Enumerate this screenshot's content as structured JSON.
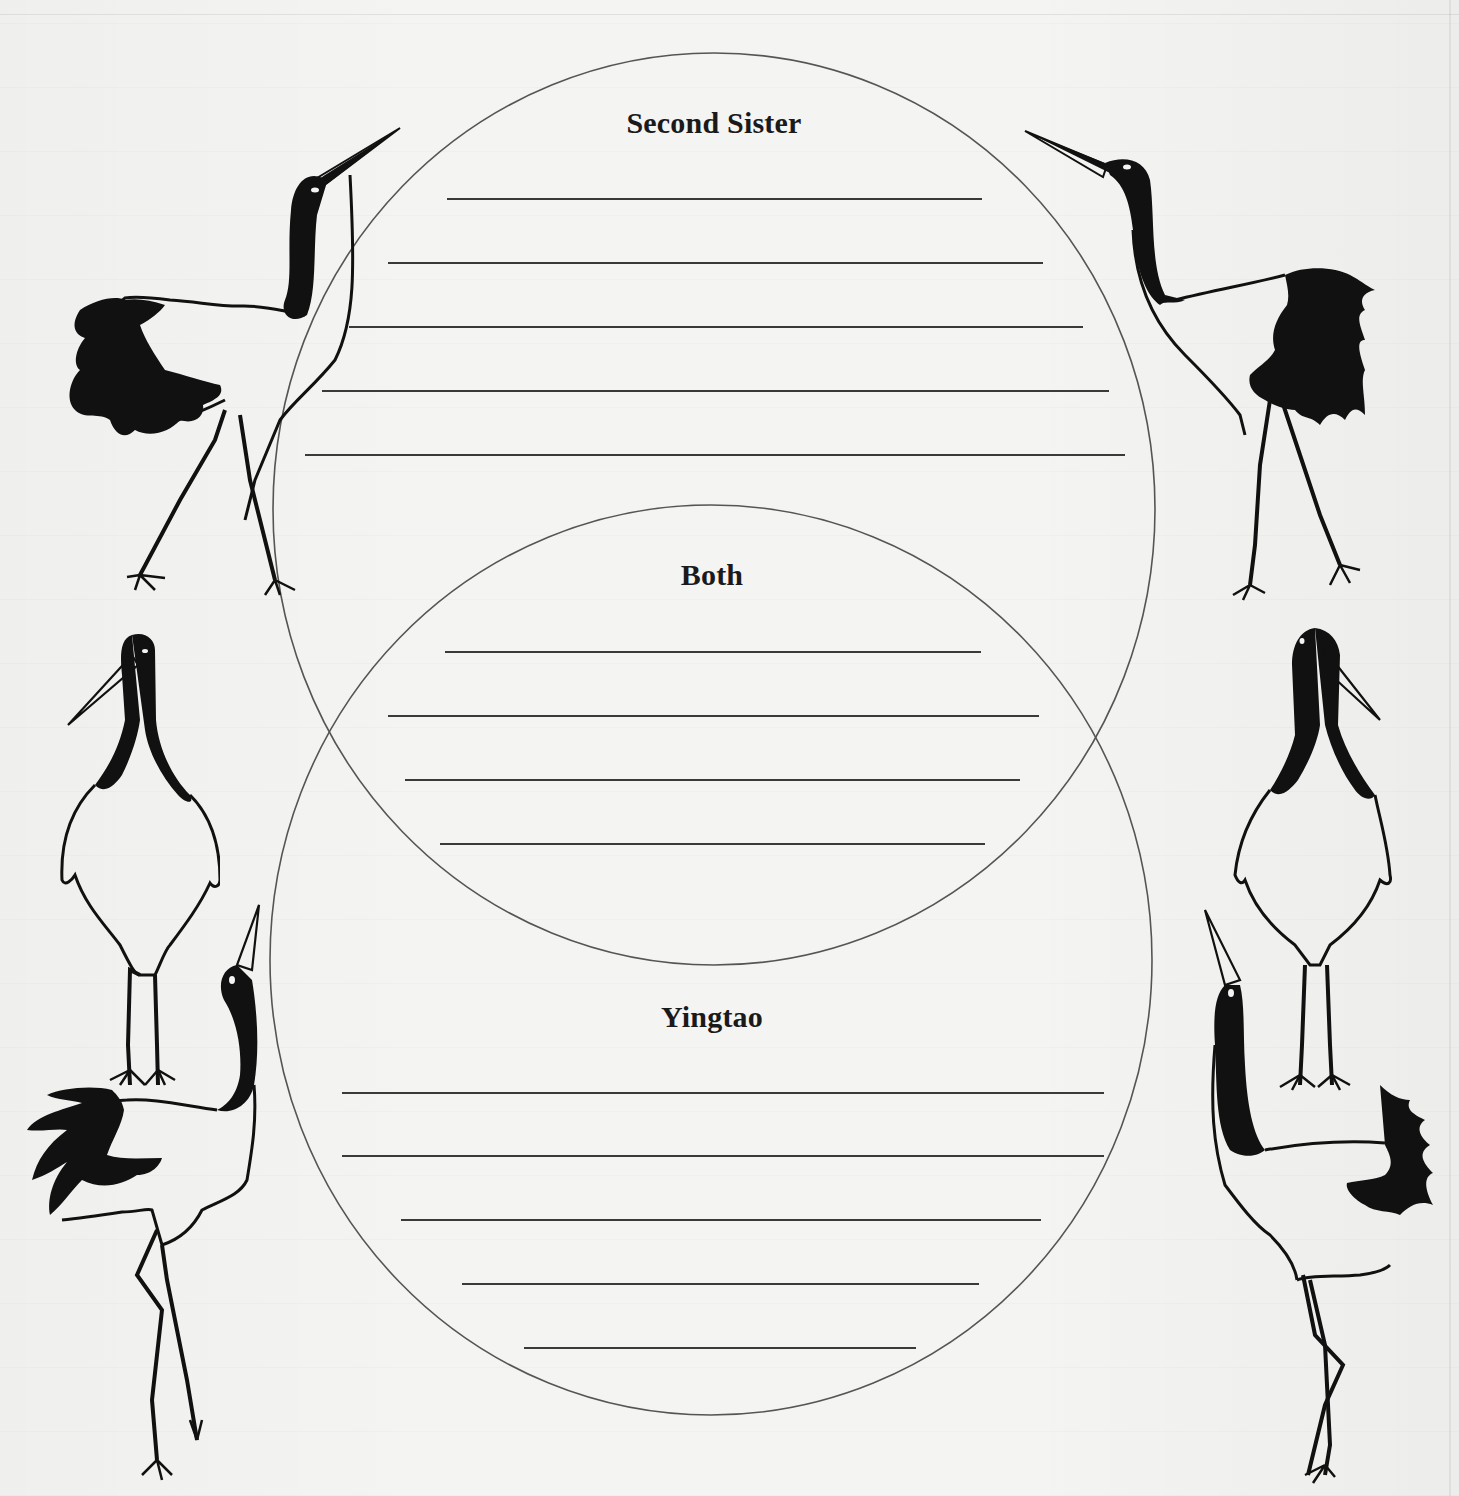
{
  "worksheet": {
    "type": "venn-diagram",
    "sections": {
      "top": {
        "label": "Second Sister"
      },
      "overlap": {
        "label": "Both"
      },
      "bottom": {
        "label": "Yingtao"
      }
    },
    "write_lines": {
      "top": [
        {
          "x1": 447,
          "x2": 982,
          "y": 198
        },
        {
          "x1": 388,
          "x2": 1043,
          "y": 262
        },
        {
          "x1": 349,
          "x2": 1083,
          "y": 326
        },
        {
          "x1": 322,
          "x2": 1109,
          "y": 390
        },
        {
          "x1": 305,
          "x2": 1125,
          "y": 454
        }
      ],
      "overlap": [
        {
          "x1": 445,
          "x2": 981,
          "y": 651
        },
        {
          "x1": 388,
          "x2": 1039,
          "y": 715
        },
        {
          "x1": 405,
          "x2": 1020,
          "y": 779
        },
        {
          "x1": 440,
          "x2": 985,
          "y": 843
        }
      ],
      "bottom": [
        {
          "x1": 342,
          "x2": 1104,
          "y": 1092
        },
        {
          "x1": 342,
          "x2": 1104,
          "y": 1155
        },
        {
          "x1": 401,
          "x2": 1041,
          "y": 1219
        },
        {
          "x1": 462,
          "x2": 979,
          "y": 1283
        },
        {
          "x1": 524,
          "x2": 916,
          "y": 1347
        }
      ]
    },
    "ovals": {
      "top": {
        "cx": 714,
        "cy": 509,
        "rx": 441,
        "ry": 456
      },
      "bottom": {
        "cx": 711,
        "cy": 960,
        "rx": 441,
        "ry": 455
      }
    },
    "decorations": [
      "crane-dancing-top-left",
      "crane-dancing-top-right",
      "crane-standing-left",
      "crane-standing-right",
      "crane-calling-bottom-left",
      "crane-calling-bottom-right"
    ]
  },
  "colors": {
    "paper": "#f4f4f2",
    "ink": "#111111",
    "oval_stroke": "#555555",
    "line": "#3a3a3a"
  }
}
